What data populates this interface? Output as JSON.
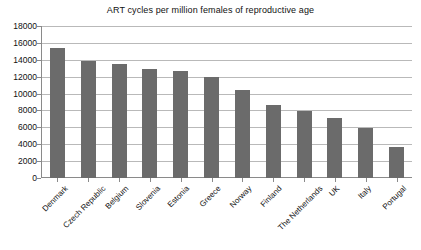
{
  "chart_data": {
    "type": "bar",
    "title": "ART cycles per million females of reproductive age",
    "xlabel": "",
    "ylabel": "",
    "ylim": [
      0,
      18000
    ],
    "ytick_step": 2000,
    "yticks": [
      "18000",
      "16000",
      "14000",
      "12000",
      "10000",
      "8000",
      "6000",
      "4000",
      "2000",
      "0"
    ],
    "grid": true,
    "legend": "none",
    "bar_color": "#6b6b6b",
    "gridline_color": "#b9b9b9",
    "axis_color": "#8a8a8a",
    "categories": [
      "Denmark",
      "Czech Republic",
      "Belgium",
      "Slovenia",
      "Estonia",
      "Greece",
      "Norway",
      "Finland",
      "The Netherlands",
      "UK",
      "Italy",
      "Portugal"
    ],
    "values": [
      15400,
      13900,
      13500,
      12900,
      12700,
      12000,
      10400,
      8600,
      7900,
      7100,
      5900,
      3700
    ]
  }
}
